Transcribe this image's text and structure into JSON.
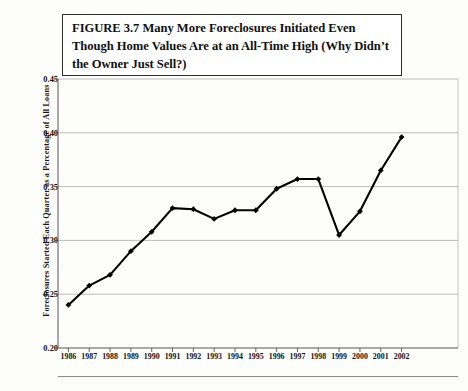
{
  "figure": {
    "title": "FIGURE 3.7  Many More Foreclosures Initiated Even Though Home Values Are at an All-Time High (Why Didn’t the Owner Just Sell?)",
    "title_label": "figure-title"
  },
  "chart_data": {
    "type": "line",
    "title": "FIGURE 3.7  Many More Foreclosures Initiated Even Though Home Values Are at an All-Time High (Why Didn’t the Owner Just Sell?)",
    "xlabel": "",
    "ylabel": "Foreclosures Started Each Quarter as a Percentage of All Loans",
    "categories": [
      "1986",
      "1987",
      "1988",
      "1989",
      "1990",
      "1991",
      "1992",
      "1993",
      "1994",
      "1995",
      "1996",
      "1997",
      "1998",
      "1999",
      "2000",
      "2001",
      "2002"
    ],
    "values": [
      0.24,
      0.258,
      0.268,
      0.29,
      0.308,
      0.33,
      0.329,
      0.32,
      0.328,
      0.328,
      0.348,
      0.357,
      0.357,
      0.305,
      0.327,
      0.365,
      0.396
    ],
    "ylim": [
      0.2,
      0.45
    ],
    "yticks": [
      "0.20",
      "0.25",
      "0.30",
      "0.35",
      "0.40",
      "0.45"
    ],
    "ytick_values": [
      0.2,
      0.25,
      0.3,
      0.35,
      0.4,
      0.45
    ],
    "grid": "horizontal",
    "legend": null,
    "series_color": "#000000",
    "marker": "diamond",
    "gridline_color": "#b4b4b4",
    "axis_color": "#555555"
  }
}
